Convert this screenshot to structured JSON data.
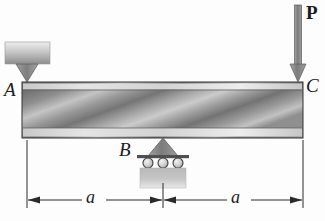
{
  "figure": {
    "type": "engineering-statics-beam-diagram",
    "background_color": "#fdfdfd",
    "ink_color": "#1b1b1b"
  },
  "labels": {
    "point_A": "A",
    "point_B": "B",
    "point_C": "C",
    "load_P": "P",
    "dimension_left": "a",
    "dimension_right": "a"
  },
  "beam": {
    "name": "beam-member-AC",
    "x": 22,
    "y": 82,
    "width": 281,
    "height": 56,
    "fill_dark": "#6f6f6f",
    "fill_light": "#cfcfcf",
    "edge_strip_color": "#d8d8d8",
    "outline_color": "#3a3a3a"
  },
  "supports": {
    "support_A": {
      "name": "pin-support-A",
      "kind": "knife-edge-wedge-from-above",
      "block_x": 5,
      "block_y": 42,
      "block_width": 45,
      "block_height": 22,
      "wedge_tip_x": 27,
      "wedge_tip_y": 82,
      "block_fill_top": "#e7e7e7",
      "block_fill_bottom": "#8e8e8e",
      "wedge_fill": "#8b8b8b"
    },
    "support_B": {
      "name": "roller-support-B",
      "kind": "roller-support-three-rollers",
      "triangle_apex_x": 163,
      "triangle_apex_y": 138,
      "triangle_half_width": 15,
      "triangle_base_y": 155,
      "plate_x": 137,
      "plate_y": 155,
      "plate_width": 52,
      "plate_height": 3,
      "roller_count": 3,
      "roller_radius": 5,
      "roller_centers_x": [
        148,
        163,
        178
      ],
      "roller_center_y": 163,
      "base_x": 140,
      "base_y": 168,
      "base_width": 46,
      "base_height": 20,
      "triangle_fill": "#8b8b8b",
      "base_fill": "#b2b2b2",
      "roller_fill": "#d6d6d6"
    }
  },
  "load": {
    "name": "point-load-P-at-C",
    "symbol": "P",
    "direction": "downward",
    "arrow_x": 298,
    "arrow_top_y": 5,
    "arrow_tip_y": 82,
    "shaft_width": 7,
    "head_half_width": 8,
    "head_height": 16,
    "fill": "#8a8a8a",
    "outline": "#4a4a4a"
  },
  "dimensions": {
    "name": "dimension-line-row",
    "line_y": 200,
    "extension_top_left_y": 140,
    "extension_top_mid_y": 183,
    "extension_top_right_y": 140,
    "ticks_x": [
      27,
      163,
      303
    ],
    "segments": [
      {
        "label": "a",
        "from_x": 27,
        "to_x": 163
      },
      {
        "label": "a",
        "from_x": 163,
        "to_x": 303
      }
    ],
    "line_color": "#2a2a2a"
  }
}
